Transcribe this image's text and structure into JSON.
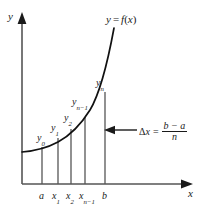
{
  "figure": {
    "type": "diagram",
    "axes": {
      "y_axis_label": "y",
      "x_axis_label": "x"
    },
    "curve_label": {
      "y": "y",
      "equals": "=",
      "f": "f",
      "open": "(",
      "var": "x",
      "close": ")",
      "full": "y = f(x)"
    },
    "ordinate_labels": [
      {
        "name": "y0",
        "base": "y",
        "sub": "0",
        "x": 37,
        "y": 133
      },
      {
        "name": "y1",
        "base": "y",
        "sub": "1",
        "x": 51,
        "y": 123
      },
      {
        "name": "y2",
        "base": "y",
        "sub": "2",
        "x": 64,
        "y": 113
      },
      {
        "name": "yn-1",
        "base": "y",
        "sub": "n−1",
        "x": 74,
        "y": 98
      },
      {
        "name": "yn",
        "base": "y",
        "sub": "n",
        "x": 96,
        "y": 79
      }
    ],
    "abscissa_labels": [
      {
        "name": "a",
        "base": "a",
        "sub": "",
        "x": 39,
        "y": 192
      },
      {
        "name": "x1",
        "base": "x",
        "sub": "1",
        "x": 53,
        "y": 192
      },
      {
        "name": "x2",
        "base": "x",
        "sub": "2",
        "x": 66,
        "y": 192
      },
      {
        "name": "xn-1",
        "base": "x",
        "sub": "n−1",
        "x": 76,
        "y": 192
      },
      {
        "name": "b",
        "base": "b",
        "sub": "",
        "x": 101,
        "y": 192
      }
    ],
    "delta_formula": {
      "delta": "Δ",
      "x": "x",
      "equals": "=",
      "numerator": "b − a",
      "denominator": "n",
      "full": "Δx = (b − a) / n"
    },
    "partition_x": [
      42,
      58,
      71,
      85,
      105
    ],
    "colors": {
      "ink": "#1a1a1a",
      "curve": "#111111",
      "background": "#ffffff"
    }
  }
}
